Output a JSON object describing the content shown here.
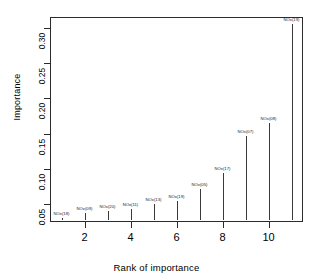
{
  "chart_data": {
    "type": "scatter",
    "title": "",
    "xlabel": "Rank of importance",
    "ylabel": "Importance",
    "xlim": [
      0.5,
      11.5
    ],
    "ylim": [
      0.025,
      0.315
    ],
    "xticks": [
      2,
      4,
      6,
      8,
      10
    ],
    "yticks": [
      0.05,
      0.1,
      0.15,
      0.2,
      0.25,
      0.3
    ],
    "ytick_labels": [
      "0.05",
      "0.10",
      "0.15",
      "0.20",
      "0.25",
      "0.30"
    ],
    "xtick_labels": [
      "2",
      "4",
      "6",
      "8",
      "10"
    ],
    "grid": false,
    "legend": "none",
    "x": [
      1,
      2,
      3,
      4,
      5,
      6,
      7,
      8,
      9,
      10,
      11
    ],
    "values": [
      0.03,
      0.038,
      0.04,
      0.043,
      0.05,
      0.055,
      0.072,
      0.095,
      0.147,
      0.165,
      0.305
    ],
    "point_labels": [
      "NOx(18)",
      "NOx(09)",
      "NOx(20)",
      "NOx(11)",
      "NOx(13)",
      "NOx(19)",
      "NOx(05)",
      "NOx(17)",
      "NOx(07)",
      "NOx(08)",
      "NOx(19)"
    ],
    "marker": "vertical-stem"
  },
  "axes": {
    "y_title": "Importance",
    "x_title": "Rank of importance"
  }
}
